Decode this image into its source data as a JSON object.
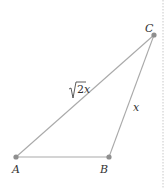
{
  "diagram": {
    "type": "triangle",
    "points": [
      {
        "name": "A",
        "label": "A",
        "x": 16,
        "y": 157
      },
      {
        "name": "B",
        "label": "B",
        "x": 109,
        "y": 157
      },
      {
        "name": "C",
        "label": "C",
        "x": 154,
        "y": 35
      }
    ],
    "edges": [
      {
        "from": "A",
        "to": "B",
        "label": ""
      },
      {
        "from": "B",
        "to": "C",
        "label": "x"
      },
      {
        "from": "A",
        "to": "C",
        "label_radical": "2",
        "label_var": "x"
      }
    ],
    "colors": {
      "edge": "#a9a9a9",
      "point": "#8f8f8f",
      "text": "#333333"
    }
  }
}
